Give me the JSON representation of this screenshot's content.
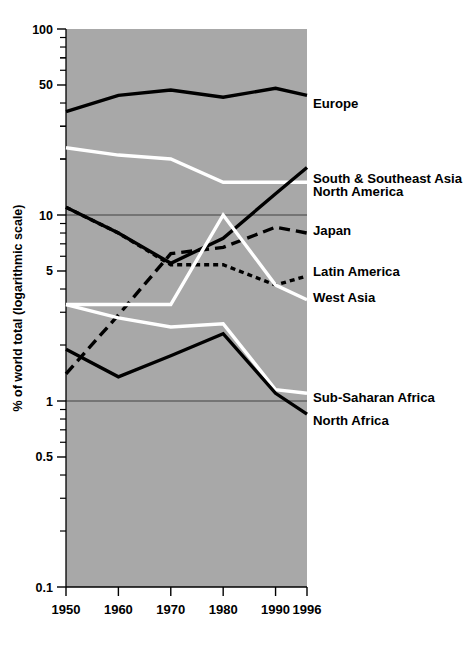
{
  "chart_data": {
    "type": "line",
    "title": "",
    "subtitle": "",
    "xlabel": "",
    "ylabel": "% of world total (logarithmic scale)",
    "scale": "log",
    "x": [
      1950,
      1960,
      1970,
      1980,
      1990,
      1996
    ],
    "xtick_labels": [
      "1950",
      "1960",
      "1970",
      "1980",
      "1990",
      "1996"
    ],
    "ytick_labels": [
      "100",
      "50",
      "10",
      "5",
      "1",
      "0.5",
      "0.1"
    ],
    "ytick_values": [
      100,
      50,
      10,
      5,
      1,
      0.5,
      0.1
    ],
    "ylim": [
      0.1,
      100
    ],
    "gridlines": [
      10,
      1
    ],
    "grid": true,
    "legend_position": "right-inline",
    "plot_background": "#a8a8a8",
    "series": [
      {
        "name": "Europe",
        "label": "Europe",
        "style": "solid",
        "color": "#000000",
        "values": [
          36,
          44,
          47,
          43,
          48,
          44
        ],
        "label_y_value": 40.0
      },
      {
        "name": "South & Southeast Asia",
        "label": "South & Southeast Asia",
        "style": "solid",
        "color": "#ffffff",
        "values": [
          23,
          21,
          20,
          15,
          15,
          15
        ],
        "label_y_value": 15.8
      },
      {
        "name": "North America",
        "label": "North America",
        "style": "solid",
        "color": "#000000",
        "values": [
          11,
          8.0,
          5.5,
          7.5,
          13,
          18
        ],
        "label_y_value": 13.4
      },
      {
        "name": "Japan",
        "label": "Japan",
        "style": "long-dash",
        "color": "#000000",
        "values": [
          1.4,
          2.9,
          6.2,
          6.7,
          8.6,
          8.0
        ],
        "label_y_value": 8.3
      },
      {
        "name": "Latin America",
        "label": "Latin America",
        "style": "short-dash",
        "color": "#000000",
        "values": [
          11,
          8.0,
          5.4,
          5.4,
          4.2,
          4.7
        ],
        "label_y_value": 5.0
      },
      {
        "name": "West Asia",
        "label": "West Asia",
        "style": "solid",
        "color": "#ffffff",
        "values": [
          3.3,
          3.3,
          3.3,
          10.0,
          4.2,
          3.5
        ],
        "label_y_value": 3.6
      },
      {
        "name": "Sub-Saharan Africa",
        "label": "Sub-Saharan Africa",
        "style": "solid",
        "color": "#ffffff",
        "values": [
          3.3,
          2.8,
          2.5,
          2.6,
          1.15,
          1.1
        ],
        "label_y_value": 1.05
      },
      {
        "name": "North Africa",
        "label": "North Africa",
        "style": "solid",
        "color": "#000000",
        "values": [
          1.9,
          1.35,
          1.75,
          2.3,
          1.1,
          0.85
        ],
        "label_y_value": 0.79
      }
    ]
  },
  "axes": {
    "y_title": "% of world total (logarithmic scale)",
    "minor_ticks_shown": true
  }
}
